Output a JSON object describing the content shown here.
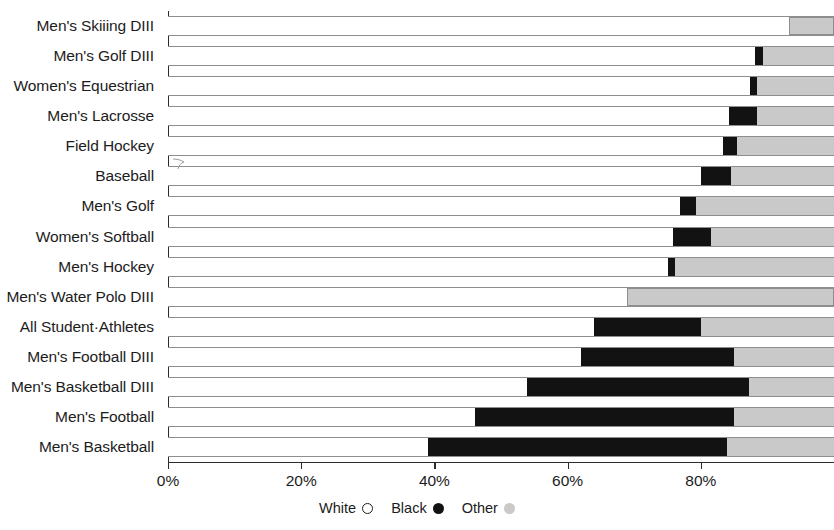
{
  "chart_data": {
    "type": "bar",
    "subtype": "stacked-horizontal-100",
    "title": "",
    "subtitle": "",
    "xlabel": "",
    "ylabel": "",
    "xlim": [
      0,
      100
    ],
    "grid": false,
    "legend_position": "bottom-center",
    "axis_tick_labels": [
      "0%",
      "20%",
      "40%",
      "60%",
      "80%"
    ],
    "axis_tick_values": [
      0,
      20,
      40,
      60,
      80
    ],
    "categories": [
      "Men's Skiiing DIII",
      "Men's Golf DIII",
      "Women's Equestrian",
      "Men's Lacrosse",
      "Field Hockey",
      "Baseball",
      "Men's Golf",
      "Women's Softball",
      "Men's Hockey",
      "Men's Water Polo DIII",
      "All Student·Athletes",
      "Men's Football DIII",
      "Men's Basketball DIII",
      "Men's Football",
      "Men's Basketball"
    ],
    "series": [
      {
        "name": "White",
        "color": "#ffffff",
        "values": [
          93.2,
          88.1,
          87.4,
          84.2,
          83.3,
          80.1,
          76.9,
          75.8,
          75.1,
          68.9,
          64.0,
          62.0,
          53.9,
          46.1,
          39.1
        ]
      },
      {
        "name": "Black",
        "color": "#121212",
        "values": [
          0.0,
          1.3,
          1.0,
          4.2,
          2.1,
          4.4,
          2.4,
          5.7,
          1.0,
          0.0,
          16.1,
          23.0,
          33.4,
          38.9,
          44.8
        ]
      },
      {
        "name": "Other",
        "color": "#c9c9c9",
        "values": [
          6.8,
          10.6,
          11.6,
          11.6,
          14.6,
          15.5,
          20.7,
          18.5,
          23.9,
          31.1,
          19.9,
          15.0,
          12.7,
          15.0,
          16.1
        ]
      }
    ]
  },
  "legend": {
    "items": [
      {
        "label": "White",
        "swatch": "white-circle-outline-icon"
      },
      {
        "label": "Black",
        "swatch": "black-filled-circle-icon"
      },
      {
        "label": "Other",
        "swatch": "gray-filled-circle-icon"
      }
    ]
  }
}
